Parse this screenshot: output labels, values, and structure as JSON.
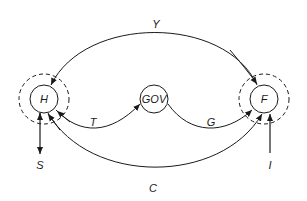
{
  "diagram": {
    "nodes": {
      "h": {
        "label": "H"
      },
      "gov": {
        "label": "GOV"
      },
      "f": {
        "label": "F"
      }
    },
    "flows": {
      "y": {
        "label": "Y",
        "from": "F",
        "to": "H"
      },
      "t": {
        "label": "T",
        "from": "H",
        "to": "GOV"
      },
      "g": {
        "label": "G",
        "from": "GOV",
        "to": "F"
      },
      "c": {
        "label": "C",
        "from": "H",
        "to": "F"
      },
      "s": {
        "label": "S",
        "from": "H",
        "to": "out"
      },
      "i": {
        "label": "I",
        "from": "in",
        "to": "F"
      }
    },
    "colors": {
      "stroke": "#1a1a1a",
      "background": "#ffffff"
    }
  }
}
